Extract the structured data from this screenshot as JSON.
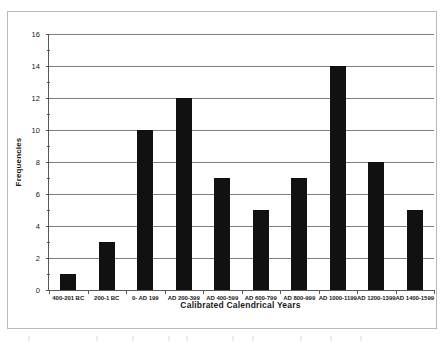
{
  "chart_data": {
    "type": "bar",
    "title": "",
    "subtitle": "",
    "xlabel": "Calibrated Calendrical Years",
    "ylabel": "Frequencies",
    "categories": [
      "400-201 BC",
      "200-1 BC",
      "0- AD 199",
      "AD 200-399",
      "AD 400-599",
      "AD 600-799",
      "AD 800-999",
      "AD 1000-1199",
      "AD 1200-1399",
      "AD 1400-1599"
    ],
    "values": [
      1,
      3,
      10,
      12,
      7,
      5,
      7,
      14,
      8,
      5
    ],
    "ylim": [
      0,
      16
    ],
    "y_major_ticks": [
      0,
      2,
      4,
      6,
      8,
      10,
      12,
      14,
      16
    ],
    "y_tick_labels": [
      "0",
      "2",
      "4",
      "6",
      "8",
      "10",
      "12",
      "14",
      "16"
    ],
    "y_minor_tick_step": 1,
    "grid": "horizontal-major",
    "legend": "none",
    "bar_color": "#111111",
    "gridline_color": "#7f7f82",
    "axis_color": "#58585a",
    "plot_background": "#ffffff",
    "frame_color": "#b9b9bb",
    "annotations": []
  }
}
